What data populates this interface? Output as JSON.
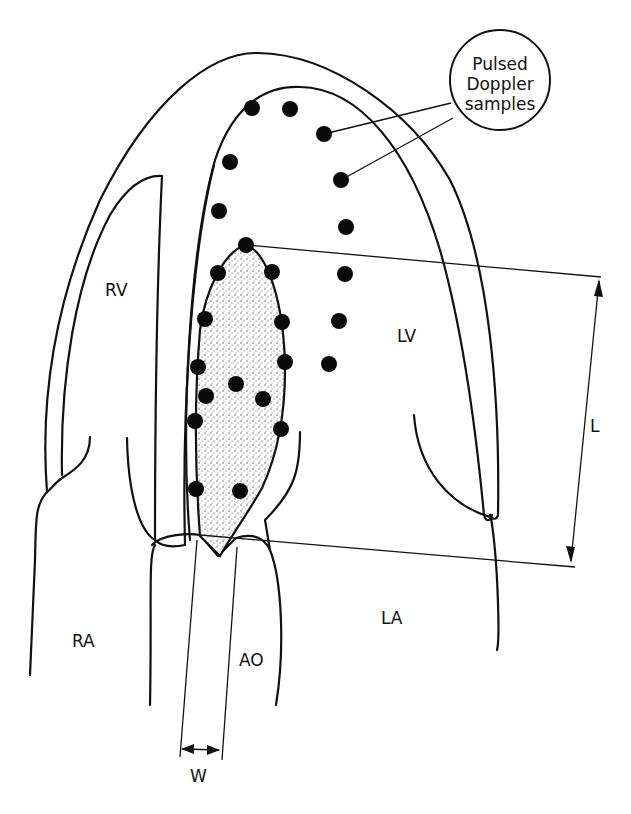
{
  "figure": {
    "labels": {
      "rv": "RV",
      "lv": "LV",
      "ra": "RA",
      "la": "LA",
      "ao": "AO",
      "length": "L",
      "width": "W"
    },
    "callout": {
      "line1": "Pulsed",
      "line2": "Doppler",
      "line3": "samples"
    },
    "colors": {
      "ink": "#111111",
      "background": "#ffffff",
      "stipple": "#555555"
    },
    "sample_points": {
      "lv_cavity": [
        [
          252,
          108
        ],
        [
          290,
          109
        ],
        [
          324,
          134
        ],
        [
          230,
          162
        ],
        [
          341,
          180
        ],
        [
          219,
          211
        ],
        [
          346,
          227
        ],
        [
          345,
          274
        ],
        [
          339,
          321
        ],
        [
          329,
          364
        ]
      ],
      "regurgitant_jet": [
        [
          246,
          245
        ],
        [
          218,
          273
        ],
        [
          272,
          272
        ],
        [
          205,
          319
        ],
        [
          282,
          322
        ],
        [
          198,
          367
        ],
        [
          285,
          362
        ],
        [
          236,
          384
        ],
        [
          206,
          396
        ],
        [
          263,
          399
        ],
        [
          195,
          421
        ],
        [
          281,
          429
        ],
        [
          196,
          489
        ],
        [
          240,
          491
        ]
      ]
    }
  }
}
